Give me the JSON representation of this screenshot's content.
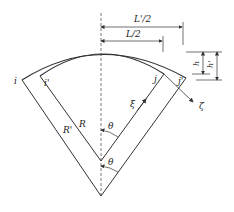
{
  "diagram": {
    "type": "geometric-cross-section",
    "colors": {
      "line": "#333333",
      "background": "#ffffff"
    },
    "labels": {
      "L_prime_half": "L'/2",
      "L_half": "L/2",
      "h": "h",
      "h_prime": "h'",
      "i": "i",
      "i_prime": "i'",
      "j": "j",
      "j_prime": "j'",
      "xi": "ξ",
      "zeta": "ζ",
      "R": "R",
      "R_prime": "R'",
      "theta_inner": "θ",
      "theta_outer": "θ"
    }
  }
}
